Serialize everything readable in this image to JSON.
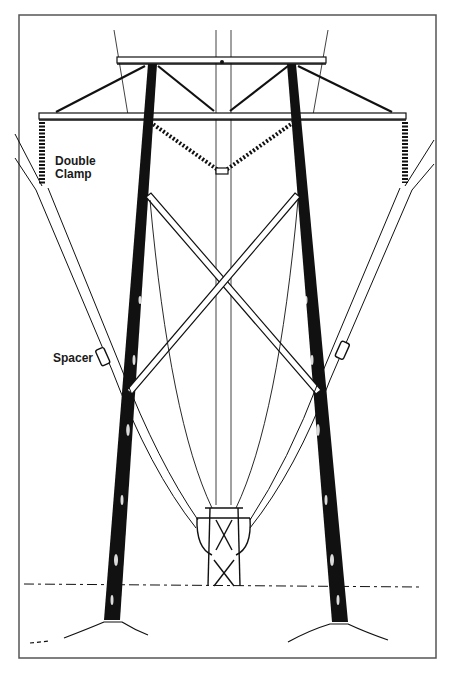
{
  "figure": {
    "colors": {
      "ink": "#111111",
      "paper": "#ffffff",
      "frame": "#555555"
    }
  },
  "labels": {
    "double_clamp": "Double\nClamp",
    "spacer": "Spacer"
  }
}
